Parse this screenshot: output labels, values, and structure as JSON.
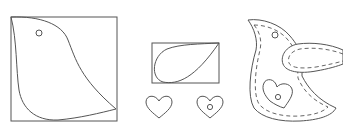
{
  "diagram": {
    "kind": "sewing pattern illustration",
    "colors": {
      "stroke": "#555555",
      "background": "#ffffff"
    },
    "pieces": [
      {
        "id": "bird-body-pattern",
        "description": "Bird body template inside a square with an eye hole"
      },
      {
        "id": "wing-pattern",
        "description": "Teardrop wing template inside a rectangle"
      },
      {
        "id": "heart-plain",
        "description": "Plain heart template"
      },
      {
        "id": "heart-button",
        "description": "Heart template with a button hole"
      },
      {
        "id": "assembled-bird",
        "description": "Assembled felt bird with dashed stitching, wing and heart appliqué"
      }
    ]
  }
}
